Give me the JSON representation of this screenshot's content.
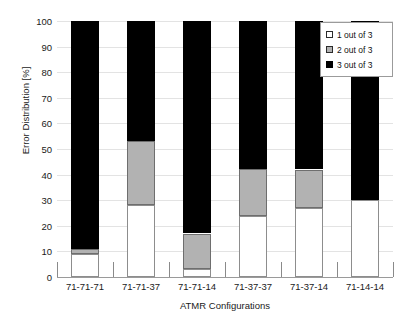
{
  "chart_data": {
    "type": "bar",
    "subtype": "stacked-bar-100",
    "title": "",
    "xlabel": "ATMR Configurations",
    "ylabel": "Error Distribution [%]",
    "ylim": [
      0,
      100
    ],
    "ytick_values": [
      0,
      10,
      20,
      30,
      40,
      50,
      60,
      70,
      80,
      90,
      100
    ],
    "ytick_labels": [
      "0",
      "10",
      "20",
      "30",
      "40",
      "50",
      "60",
      "70",
      "80",
      "90",
      "100"
    ],
    "grid": true,
    "legend_position": "top-right",
    "categories": [
      "71-71-71",
      "71-71-37",
      "71-71-14",
      "71-37-37",
      "71-37-14",
      "71-14-14"
    ],
    "series": [
      {
        "name": "1 out of 3",
        "color": "#ffffff",
        "values": [
          9,
          28,
          3,
          24,
          27,
          30
        ]
      },
      {
        "name": "2 out of 3",
        "color": "#b2b2b2",
        "values": [
          2,
          25,
          14,
          18,
          15,
          0
        ]
      },
      {
        "name": "3 out of 3",
        "color": "#000000",
        "values": [
          89,
          47,
          83,
          58,
          58,
          70
        ]
      }
    ],
    "legend_entries": [
      "1 out of 3",
      "2 out of 3",
      "3 out of 3"
    ]
  }
}
